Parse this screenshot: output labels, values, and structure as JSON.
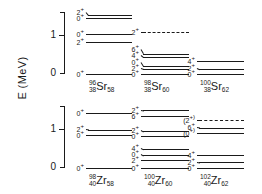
{
  "figure": {
    "axis_label": "E (MeV)",
    "tick_labels": [
      "1",
      "0"
    ],
    "axis_range_mev": [
      0,
      1.6
    ]
  },
  "chart_data": {
    "type": "table",
    "ylabel": "E (MeV)",
    "ylim": [
      0,
      1.6
    ],
    "ytick_values": [
      0,
      1
    ],
    "ytick_labels": [
      "0",
      "1"
    ],
    "grid": false,
    "legend": "none",
    "panels": [
      {
        "row": 0,
        "col": 0,
        "nuclide": {
          "mass": "96",
          "proton": "38",
          "symbol": "Sr",
          "neutron": "58"
        },
        "levels": [
          {
            "jpi": "0",
            "parity": "+",
            "energy": 0.0,
            "style": "solid"
          },
          {
            "jpi": "2",
            "parity": "+",
            "energy": 0.82,
            "style": "solid"
          },
          {
            "jpi": "0",
            "parity": "+",
            "energy": 1.03,
            "style": "solid"
          },
          {
            "jpi": "0",
            "parity": "+",
            "energy": 1.46,
            "style": "solid"
          },
          {
            "jpi": "2",
            "parity": "+",
            "energy": 1.54,
            "style": "solid"
          }
        ]
      },
      {
        "row": 0,
        "col": 1,
        "nuclide": {
          "mass": "98",
          "proton": "38",
          "symbol": "Sr",
          "neutron": "60"
        },
        "levels": [
          {
            "jpi": "0",
            "parity": "+",
            "energy": 0.0,
            "style": "solid"
          },
          {
            "jpi": "2",
            "parity": "+",
            "energy": 0.14,
            "style": "solid"
          },
          {
            "jpi": "0",
            "parity": "+",
            "energy": 0.22,
            "style": "solid"
          },
          {
            "jpi": "4",
            "parity": "+",
            "energy": 0.43,
            "style": "solid"
          },
          {
            "jpi": "6",
            "parity": "+",
            "energy": 0.53,
            "style": "solid"
          },
          {
            "jpi": "2",
            "parity": "+",
            "energy": 1.1,
            "style": "dashed"
          }
        ]
      },
      {
        "row": 0,
        "col": 2,
        "nuclide": {
          "mass": "100",
          "proton": "38",
          "symbol": "Sr",
          "neutron": "62"
        },
        "levels": [
          {
            "jpi": "0",
            "parity": "+",
            "energy": 0.0,
            "style": "solid"
          },
          {
            "jpi": "2",
            "parity": "+",
            "energy": 0.13,
            "style": "solid"
          },
          {
            "jpi": "4",
            "parity": "+",
            "energy": 0.35,
            "style": "solid"
          }
        ]
      },
      {
        "row": 1,
        "col": 0,
        "nuclide": {
          "mass": "98",
          "proton": "40",
          "symbol": "Zr",
          "neutron": "58"
        },
        "levels": [
          {
            "jpi": "0",
            "parity": "+",
            "energy": 0.0,
            "style": "solid"
          },
          {
            "jpi": "0",
            "parity": "+",
            "energy": 0.85,
            "style": "solid"
          },
          {
            "jpi": "2",
            "parity": "+",
            "energy": 1.0,
            "style": "solid"
          },
          {
            "jpi": "0",
            "parity": "+",
            "energy": 1.44,
            "style": "solid"
          }
        ]
      },
      {
        "row": 1,
        "col": 1,
        "nuclide": {
          "mass": "100",
          "proton": "40",
          "symbol": "Zr",
          "neutron": "60"
        },
        "levels": [
          {
            "jpi": "0",
            "parity": "+",
            "energy": 0.0,
            "style": "solid"
          },
          {
            "jpi": "2",
            "parity": "+",
            "energy": 0.21,
            "style": "solid"
          },
          {
            "jpi": "0",
            "parity": "+",
            "energy": 0.33,
            "style": "solid"
          },
          {
            "jpi": "4",
            "parity": "+",
            "energy": 0.5,
            "style": "solid"
          },
          {
            "jpi": "0",
            "parity": "+",
            "energy": 0.83,
            "style": "solid"
          },
          {
            "jpi": "2",
            "parity": "+",
            "energy": 0.95,
            "style": "solid"
          },
          {
            "jpi": "6",
            "parity": "+",
            "energy": 1.35,
            "style": "solid"
          },
          {
            "jpi": "2",
            "parity": "+",
            "energy": 1.5,
            "style": "solid"
          }
        ]
      },
      {
        "row": 1,
        "col": 2,
        "nuclide": {
          "mass": "102",
          "proton": "40",
          "symbol": "Zr",
          "neutron": "62"
        },
        "levels": [
          {
            "jpi": "0",
            "parity": "+",
            "energy": 0.0,
            "style": "solid"
          },
          {
            "jpi": "2",
            "parity": "+",
            "energy": 0.15,
            "style": "solid"
          },
          {
            "jpi": "4",
            "parity": "+",
            "energy": 0.33,
            "style": "solid"
          },
          {
            "jpi": "(0",
            "parity": "+)",
            "energy": 0.9,
            "style": "solid"
          },
          {
            "jpi": "6",
            "parity": "+",
            "energy": 1.05,
            "style": "solid"
          },
          {
            "jpi": "(2",
            "parity": "+)",
            "energy": 1.25,
            "style": "dashed"
          }
        ]
      }
    ]
  }
}
